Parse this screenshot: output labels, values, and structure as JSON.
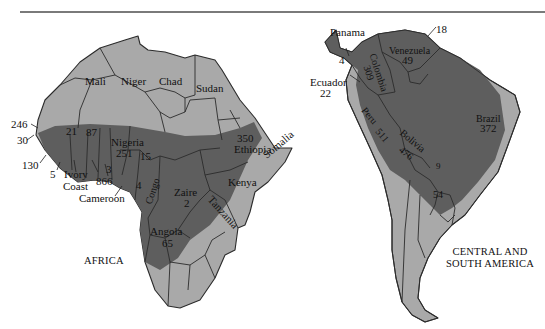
{
  "figure": {
    "colors": {
      "background": "#ffffff",
      "endemic_low_shade": "#a9a9a9",
      "endemic_high_shade": "#5e5e5e",
      "border": "#2b2b2b",
      "rule": "#7a7a7a"
    }
  },
  "africa": {
    "title": "AFRICA",
    "countries": [
      {
        "name": "Mali",
        "value": null
      },
      {
        "name": "Niger",
        "value": null
      },
      {
        "name": "Chad",
        "value": null
      },
      {
        "name": "Sudan",
        "value": null
      },
      {
        "name": "Ethiopia",
        "value": "350"
      },
      {
        "name": "Somalia",
        "value": null
      },
      {
        "name": "Nigeria",
        "value": "251"
      },
      {
        "name": "Kenya",
        "value": null
      },
      {
        "name": "Tanzania",
        "value": null
      },
      {
        "name": "Zaire",
        "value": "2"
      },
      {
        "name": "Angola",
        "value": "65"
      },
      {
        "name": "Congo",
        "value": null
      },
      {
        "name": "Ivory Coast",
        "value": null
      },
      {
        "name": "Cameroon",
        "value": null
      }
    ],
    "labels": {
      "mali": "Mali",
      "niger": "Niger",
      "chad": "Chad",
      "sudan": "Sudan",
      "ethiopia": "Ethiopia",
      "ethiopia_value": "350",
      "somalia": "Somalia",
      "nigeria": "Nigeria",
      "nigeria_value": "251",
      "kenya": "Kenya",
      "tanzania": "Tanzania",
      "zaire": "Zaire",
      "zaire_value": "2",
      "angola": "Angola",
      "angola_value": "65",
      "congo": "Congo",
      "ivory_coast_line1": "Ivory",
      "ivory_coast_line2": "Coast",
      "cameroon": "Cameroon"
    },
    "numbers": {
      "n246": "246",
      "n30": "30",
      "n130": "130",
      "n5": "5",
      "n21": "21",
      "n87": "87",
      "n3": "3",
      "n866": "866",
      "n15": "15",
      "n4": "4"
    }
  },
  "south_america": {
    "title_line1": "CENTRAL AND",
    "title_line2": "SOUTH AMERICA",
    "labels": {
      "panama": "Panama",
      "panama_value": "4",
      "venezuela": "Venezuela",
      "venezuela_value": "49",
      "colombia": "Colombia",
      "colombia_value": "309",
      "ecuador": "Ecuador",
      "ecuador_value": "22",
      "peru": "Peru",
      "peru_value": "511",
      "bolivia": "Bolivia",
      "bolivia_value": "476",
      "brazil": "Brazil",
      "brazil_value": "372"
    },
    "numbers": {
      "n18": "18",
      "n9": "9",
      "n54": "54"
    }
  }
}
